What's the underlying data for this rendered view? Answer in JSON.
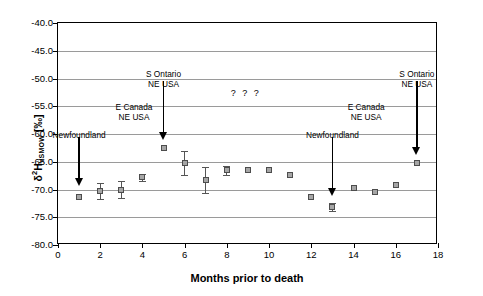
{
  "chart_data": {
    "type": "scatter",
    "title": "",
    "xlabel": "Months prior to death",
    "ylabel_parts": {
      "delta": "δ",
      "sup": "2",
      "h": "H",
      "sub": "VSMOW",
      "units": "[‰]"
    },
    "ylabel": "δ2HVSMOW [‰]",
    "xlim": [
      0,
      18
    ],
    "ylim": [
      -80.0,
      -40.0
    ],
    "xticks": [
      0,
      2,
      4,
      6,
      8,
      10,
      12,
      14,
      16,
      18
    ],
    "xtick_labels": [
      "0",
      "2",
      "4",
      "6",
      "8",
      "10",
      "12",
      "14",
      "16",
      "18"
    ],
    "yticks": [
      -40.0,
      -45.0,
      -50.0,
      -55.0,
      -60.0,
      -65.0,
      -70.0,
      -75.0,
      -80.0
    ],
    "ytick_labels": [
      "-40.0",
      "-45.0",
      "-50.0",
      "-55.0",
      "-60.0",
      "-65.0",
      "-70.0",
      "-75.0",
      "-80.0"
    ],
    "grid": true,
    "legend": "none",
    "marker": {
      "shape": "square",
      "fill": "#a6a6a6",
      "edge": "#4d4d4d"
    },
    "points": [
      {
        "x": 1,
        "y": -71.4,
        "err": 0.0
      },
      {
        "x": 2,
        "y": -70.3,
        "err": 1.5
      },
      {
        "x": 3,
        "y": -70.0,
        "err": 1.6
      },
      {
        "x": 4,
        "y": -67.8,
        "err": 0.6
      },
      {
        "x": 5,
        "y": -62.5,
        "err": 0.0
      },
      {
        "x": 6,
        "y": -65.2,
        "err": 2.1
      },
      {
        "x": 7,
        "y": -68.3,
        "err": 2.4
      },
      {
        "x": 8,
        "y": -66.5,
        "err": 0.8
      },
      {
        "x": 9,
        "y": -66.4,
        "err": 0.0
      },
      {
        "x": 10,
        "y": -66.4,
        "err": 0.0
      },
      {
        "x": 11,
        "y": -67.3,
        "err": 0.0
      },
      {
        "x": 12,
        "y": -71.3,
        "err": 0.0
      },
      {
        "x": 13,
        "y": -73.2,
        "err": 0.7
      },
      {
        "x": 14,
        "y": -69.8,
        "err": 0.0
      },
      {
        "x": 15,
        "y": -70.4,
        "err": 0.0
      },
      {
        "x": 16,
        "y": -69.2,
        "err": 0.0
      },
      {
        "x": 17,
        "y": -65.2,
        "err": 0.0
      }
    ],
    "annotations": [
      {
        "name": "newfoundland-left",
        "text": "Newfoundland",
        "x": 1,
        "label_y": -59.2,
        "arrow_from": -60.5,
        "arrow_to": -69.3
      },
      {
        "name": "e-canada-left",
        "text": "E Canada\nNE USA",
        "x": 3.6,
        "label_y": -54.3,
        "arrow_from": null,
        "arrow_to": null
      },
      {
        "name": "s-ontario-left",
        "text": "S Ontario\nNE USA",
        "x": 5,
        "label_y": -48.3,
        "arrow_from": -50.5,
        "arrow_to": -61.0
      },
      {
        "name": "question-marks",
        "text": "? ? ?",
        "x": 8.9,
        "label_y": -51.8,
        "arrow_from": null,
        "arrow_to": null
      },
      {
        "name": "newfoundland-right",
        "text": "Newfoundland",
        "x": 13,
        "label_y": -59.2,
        "arrow_from": -60.5,
        "arrow_to": -71.2
      },
      {
        "name": "e-canada-right",
        "text": "E Canada\nNE USA",
        "x": 14.6,
        "label_y": -54.3,
        "arrow_from": null,
        "arrow_to": null
      },
      {
        "name": "s-ontario-right",
        "text": "S Ontario\nNE USA",
        "x": 17,
        "label_y": -48.3,
        "arrow_from": -50.5,
        "arrow_to": -63.7
      }
    ]
  }
}
